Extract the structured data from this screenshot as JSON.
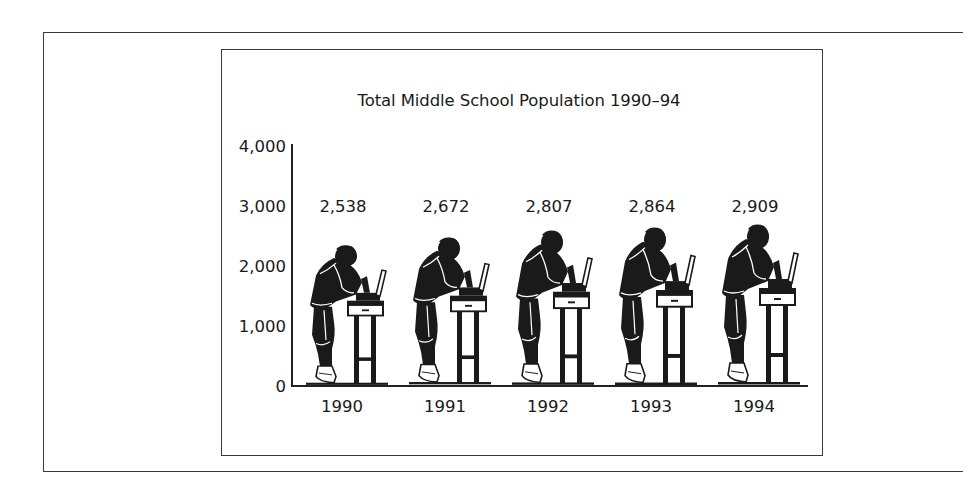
{
  "chart_data": {
    "type": "bar",
    "style": "pictograph",
    "title": "Total Middle School Population 1990–94",
    "xlabel": "",
    "ylabel": "",
    "categories": [
      "1990",
      "1991",
      "1992",
      "1993",
      "1994"
    ],
    "values": [
      2538,
      2672,
      2807,
      2864,
      2909
    ],
    "value_labels": [
      "2,538",
      "2,672",
      "2,807",
      "2,864",
      "2,909"
    ],
    "yticks": [
      0,
      1000,
      2000,
      3000,
      4000
    ],
    "ytick_labels": [
      "0",
      "1,000",
      "2,000",
      "3,000",
      "4,000"
    ],
    "ylim": [
      0,
      4000
    ],
    "grid": false,
    "legend": null,
    "pictogram": "student-at-microscope-icon"
  },
  "colors": {
    "ink": "#1a1a1a",
    "background": "#ffffff",
    "frame": "#3a3a3a"
  }
}
